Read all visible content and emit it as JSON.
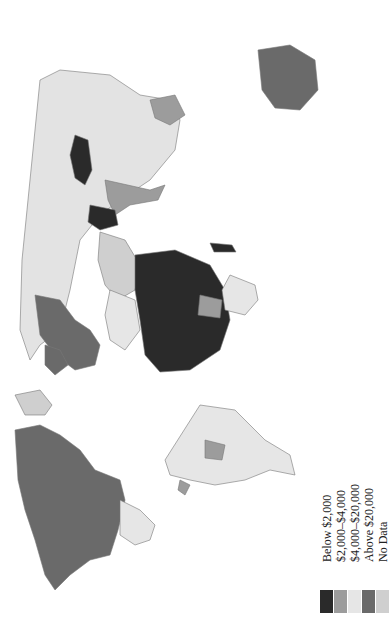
{
  "map": {
    "title": "",
    "orientation": "rotated 90 degrees clockwise",
    "stroke_color": "#777777",
    "background": "#ffffff"
  },
  "legend": {
    "items": [
      {
        "label": "Below $2,000",
        "color": "#2a2a2a"
      },
      {
        "label": "$2,000–$4,000",
        "color": "#9c9c9c"
      },
      {
        "label": "$4,000–$20,000",
        "color": "#e6e6e6"
      },
      {
        "label": "Above $20,000",
        "color": "#6a6a6a"
      },
      {
        "label": "No Data",
        "color": "#cfcfcf"
      }
    ]
  },
  "regions": [
    {
      "name": "Russia / Northern Asia",
      "category": "$4,000–$20,000"
    },
    {
      "name": "Central Asia (dark patch)",
      "category": "Below $2,000"
    },
    {
      "name": "Sub-Saharan Africa",
      "category": "Below $2,000"
    },
    {
      "name": "Southern Africa",
      "category": "$4,000–$20,000"
    },
    {
      "name": "North Africa",
      "category": "$4,000–$20,000"
    },
    {
      "name": "Western Europe",
      "category": "Above $20,000"
    },
    {
      "name": "Australia",
      "category": "Above $20,000"
    },
    {
      "name": "India / South Asia",
      "category": "$2,000–$4,000"
    },
    {
      "name": "North America (USA/Canada)",
      "category": "Above $20,000"
    },
    {
      "name": "Central America / Mexico",
      "category": "$4,000–$20,000"
    },
    {
      "name": "South America",
      "category": "$4,000–$20,000"
    },
    {
      "name": "Greenland",
      "category": "No Data"
    }
  ]
}
